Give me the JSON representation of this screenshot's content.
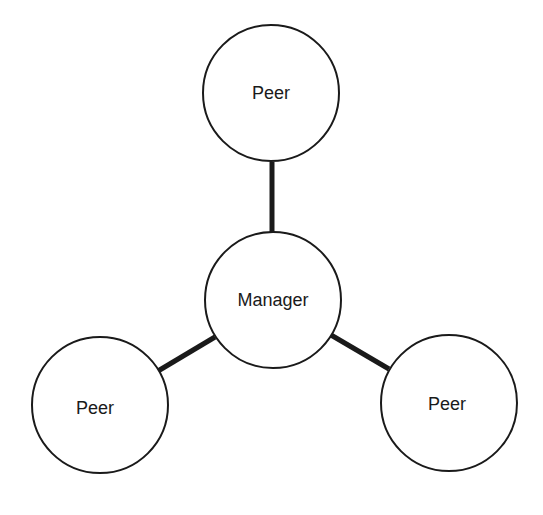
{
  "diagram": {
    "type": "star-topology",
    "nodes": [
      {
        "id": "peer-top",
        "label": "Peer",
        "cx": 271,
        "cy": 93,
        "r": 68
      },
      {
        "id": "manager",
        "label": "Manager",
        "cx": 273,
        "cy": 300,
        "r": 68
      },
      {
        "id": "peer-left",
        "label": "Peer",
        "cx": 100,
        "cy": 405,
        "r": 68
      },
      {
        "id": "peer-right",
        "label": "Peer",
        "cx": 449,
        "cy": 403,
        "r": 68
      }
    ],
    "edges": [
      {
        "from": "manager",
        "to": "peer-top"
      },
      {
        "from": "manager",
        "to": "peer-left"
      },
      {
        "from": "manager",
        "to": "peer-right"
      }
    ],
    "colors": {
      "stroke": "#1a1a1a",
      "fill": "#ffffff"
    }
  }
}
